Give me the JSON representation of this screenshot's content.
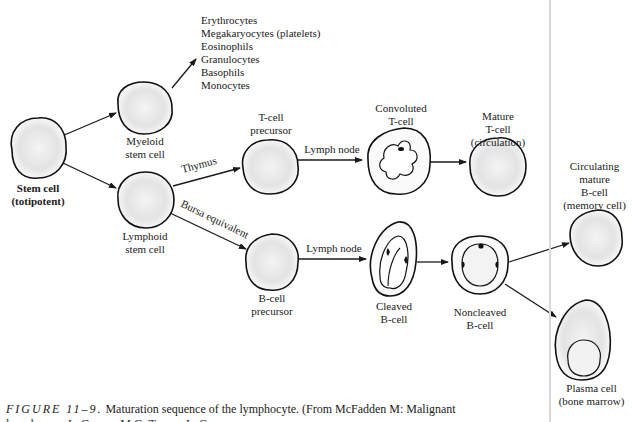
{
  "figure": {
    "title": "Maturation sequence of the lymphocyte",
    "caption_prefix": "FIGURE 11–9.",
    "caption_text": " Maturation sequence of the lymphocyte. (From McFadden M: Malignant",
    "caption_line2": "lymphomas. In Grosse, M.G. Tumor. In Cancer"
  },
  "nodes": {
    "stem_cell": {
      "line1": "Stem cell",
      "line2": "(totipotent)"
    },
    "myeloid": {
      "line1": "Myeloid",
      "line2": "stem cell"
    },
    "lymphoid": {
      "line1": "Lymphoid",
      "line2": "stem cell"
    },
    "t_precursor": {
      "line1": "T-cell",
      "line2": "precursor"
    },
    "convoluted_t": {
      "line1": "Convoluted",
      "line2": "T-cell"
    },
    "mature_t": {
      "line1": "Mature",
      "line2": "T-cell",
      "line3": "(circulation)"
    },
    "b_precursor": {
      "line1": "B-cell",
      "line2": "precursor"
    },
    "cleaved_b": {
      "line1": "Cleaved",
      "line2": "B-cell"
    },
    "noncleaved_b": {
      "line1": "Noncleaved",
      "line2": "B-cell"
    },
    "memory_b": {
      "line1": "Circulating",
      "line2": "mature",
      "line3": "B-cell",
      "line4": "(memory cell)"
    },
    "plasma": {
      "line1": "Plasma cell",
      "line2": "(bone marrow)"
    }
  },
  "myeloid_products": [
    "Erythrocytes",
    "Megakaryocytes (platelets)",
    "Eosinophils",
    "Granulocytes",
    "Basophils",
    "Monocytes"
  ],
  "edges": {
    "thymus": "Thymus",
    "bursa": "Bursa equivalent",
    "lymph_node_t": "Lymph node",
    "lymph_node_b": "Lymph node"
  }
}
